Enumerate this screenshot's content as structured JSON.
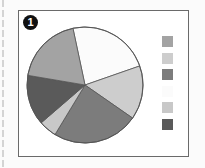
{
  "figure": {
    "badge_number": "1"
  },
  "chart_data": {
    "type": "pie",
    "title": "",
    "legend_position": "right",
    "legend_labels_visible": false,
    "slices": [
      {
        "label": "",
        "value": 23,
        "color": "#fbfbfb"
      },
      {
        "label": "",
        "value": 15,
        "color": "#cdcdcd"
      },
      {
        "label": "",
        "value": 24,
        "color": "#7c7c7c"
      },
      {
        "label": "",
        "value": 5,
        "color": "#c8c8c8"
      },
      {
        "label": "",
        "value": 14,
        "color": "#5a5a5a"
      },
      {
        "label": "",
        "value": 19,
        "color": "#a3a3a3"
      }
    ],
    "start_angle_deg": 348,
    "legend_colors": [
      "#a3a3a3",
      "#cdcdcd",
      "#7c7c7c",
      "#fbfbfb",
      "#c8c8c8",
      "#5a5a5a"
    ]
  }
}
